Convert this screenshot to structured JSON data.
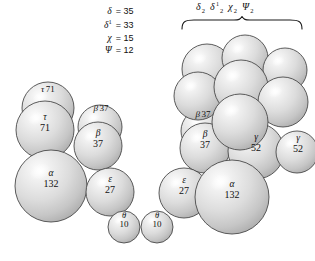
{
  "figure": {
    "background_color": "#ffffff",
    "sphere_fill_light": "#f2f2f2",
    "sphere_fill_mid": "#d2d2d2",
    "sphere_fill_dark": "#b4b4b4",
    "sphere_stroke": "#4a4a4a",
    "text_color": "#111111"
  },
  "legend": {
    "name": "parameter-legend",
    "rows": [
      {
        "symbol": "δ",
        "superscript": "",
        "equals": "=",
        "value": "35"
      },
      {
        "symbol": "δ",
        "superscript": "1",
        "equals": "=",
        "value": "33"
      },
      {
        "symbol": "χ",
        "superscript": "",
        "equals": "=",
        "value": "15"
      },
      {
        "symbol": "Ψ",
        "superscript": "",
        "equals": "=",
        "value": "12"
      }
    ]
  },
  "brace": {
    "name": "group-brace",
    "label_parts": [
      {
        "symbol": "δ",
        "sub": "2",
        "sup": ""
      },
      {
        "symbol": "δ",
        "sub": "2",
        "sup": "1"
      },
      {
        "symbol": "χ",
        "sub": "2",
        "sup": ""
      },
      {
        "symbol": "Ψ",
        "sub": "2",
        "sup": ""
      }
    ],
    "label_text": "δ2 δ12 χ2 Ψ2"
  },
  "spheres": [
    {
      "id": "left-tau-back",
      "cx": 48,
      "cy": 108,
      "r": 26,
      "layer": 0,
      "label": {
        "greek": "τ",
        "value": "71",
        "style": "inline",
        "lx": 48,
        "ly": 87
      }
    },
    {
      "id": "left-beta-back",
      "cx": 100,
      "cy": 127,
      "r": 22,
      "layer": 0,
      "label": {
        "greek": "β",
        "value": "37",
        "style": "inline",
        "lx": 101,
        "ly": 106
      }
    },
    {
      "id": "left-tau-front",
      "cx": 45,
      "cy": 130,
      "r": 29,
      "layer": 1,
      "label": {
        "greek": "τ",
        "value": "71",
        "style": "stacked",
        "lx": 45,
        "ly": 123
      }
    },
    {
      "id": "left-beta-front",
      "cx": 98,
      "cy": 146,
      "r": 24,
      "layer": 1,
      "label": {
        "greek": "β",
        "value": "37",
        "style": "stacked",
        "lx": 98,
        "ly": 139
      }
    },
    {
      "id": "left-alpha",
      "cx": 51,
      "cy": 186,
      "r": 36,
      "layer": 2,
      "label": {
        "greek": "α",
        "value": "132",
        "style": "stacked",
        "lx": 51,
        "ly": 179
      }
    },
    {
      "id": "left-epsilon",
      "cx": 110,
      "cy": 192,
      "r": 24,
      "layer": 2,
      "label": {
        "greek": "ε",
        "value": "27",
        "style": "stacked",
        "lx": 110,
        "ly": 185
      }
    },
    {
      "id": "left-theta",
      "cx": 124,
      "cy": 227,
      "r": 16,
      "layer": 3,
      "label": {
        "greek": "θ",
        "value": "10",
        "style": "stacked-small",
        "lx": 124,
        "ly": 220
      }
    },
    {
      "id": "right-theta",
      "cx": 157,
      "cy": 227,
      "r": 16,
      "layer": 3,
      "label": {
        "greek": "θ",
        "value": "10",
        "style": "stacked-small",
        "lx": 157,
        "ly": 220
      }
    },
    {
      "id": "right-epsilon",
      "cx": 184,
      "cy": 193,
      "r": 25,
      "layer": 2,
      "label": {
        "greek": "ε",
        "value": "27",
        "style": "stacked",
        "lx": 184,
        "ly": 186
      }
    },
    {
      "id": "right-alpha",
      "cx": 232,
      "cy": 197,
      "r": 37,
      "layer": 2,
      "label": {
        "greek": "α",
        "value": "132",
        "style": "stacked",
        "lx": 232,
        "ly": 190
      }
    },
    {
      "id": "right-beta-back",
      "cx": 203,
      "cy": 131,
      "r": 22,
      "layer": 0,
      "label": {
        "greek": "β",
        "value": "37",
        "style": "inline",
        "lx": 203,
        "ly": 112
      }
    },
    {
      "id": "right-beta-front",
      "cx": 205,
      "cy": 148,
      "r": 25,
      "layer": 1,
      "label": {
        "greek": "β",
        "value": "37",
        "style": "stacked",
        "lx": 205,
        "ly": 140
      }
    },
    {
      "id": "right-gamma-1",
      "cx": 256,
      "cy": 151,
      "r": 28,
      "layer": 1,
      "label": {
        "greek": "γ",
        "value": "52",
        "style": "stacked",
        "lx": 256,
        "ly": 143
      }
    },
    {
      "id": "right-gamma-2",
      "cx": 297,
      "cy": 152,
      "r": 21,
      "layer": 1,
      "label": {
        "greek": "γ",
        "value": "52",
        "style": "stacked",
        "lx": 298,
        "ly": 144
      }
    },
    {
      "id": "cluster-top-1",
      "cx": 207,
      "cy": 69,
      "r": 25,
      "layer": 0,
      "label": null
    },
    {
      "id": "cluster-top-2",
      "cx": 245,
      "cy": 58,
      "r": 23,
      "layer": 0,
      "label": null
    },
    {
      "id": "cluster-top-3",
      "cx": 285,
      "cy": 70,
      "r": 22,
      "layer": 0,
      "label": null
    },
    {
      "id": "cluster-mid-1",
      "cx": 198,
      "cy": 96,
      "r": 24,
      "layer": 1,
      "label": null
    },
    {
      "id": "cluster-mid-2",
      "cx": 241,
      "cy": 87,
      "r": 27,
      "layer": 1,
      "label": null
    },
    {
      "id": "cluster-mid-3",
      "cx": 283,
      "cy": 102,
      "r": 25,
      "layer": 1,
      "label": null
    },
    {
      "id": "cluster-low-1",
      "cx": 240,
      "cy": 122,
      "r": 28,
      "layer": 2,
      "label": null
    }
  ]
}
